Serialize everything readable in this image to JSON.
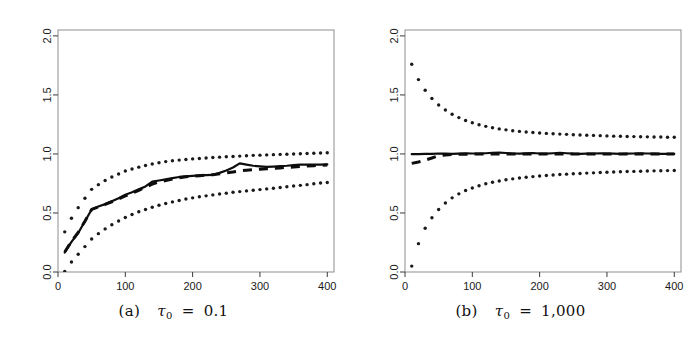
{
  "figure": {
    "panel_count": 2
  },
  "panels": [
    {
      "id": "a",
      "caption_label": "(a)",
      "caption_symbol": "τ",
      "caption_subscript": "0",
      "caption_equals": "=",
      "caption_value": "0.1",
      "caption_full": "(a) τ₀ = 0.1"
    },
    {
      "id": "b",
      "caption_label": "(b)",
      "caption_symbol": "τ",
      "caption_subscript": "0",
      "caption_equals": "=",
      "caption_value": "1,000",
      "caption_full": "(b) τ₀ = 1,000"
    }
  ],
  "chart_data": [
    {
      "type": "line",
      "panel": "a",
      "title": "(a) τ₀ = 0.1",
      "xlabel": "",
      "ylabel": "",
      "xlim": [
        0,
        410
      ],
      "ylim": [
        0.0,
        2.05
      ],
      "xticks": [
        0,
        100,
        200,
        300,
        400
      ],
      "xticklabels": [
        "0",
        "100",
        "200",
        "300",
        "400"
      ],
      "yticks": [
        0.0,
        0.5,
        1.0,
        1.5,
        2.0
      ],
      "yticklabels": [
        "0.0",
        "0.5",
        "1.0",
        "1.5",
        "2.0"
      ],
      "grid": false,
      "legend": "none",
      "x": [
        10,
        20,
        30,
        40,
        50,
        60,
        70,
        80,
        90,
        100,
        110,
        120,
        130,
        140,
        150,
        160,
        170,
        180,
        190,
        200,
        210,
        220,
        230,
        240,
        250,
        260,
        270,
        280,
        290,
        300,
        310,
        320,
        330,
        340,
        350,
        360,
        370,
        380,
        390,
        400
      ],
      "series": [
        {
          "name": "solid-estimate",
          "style": "solid",
          "values": [
            0.165,
            0.255,
            0.33,
            0.43,
            0.53,
            0.555,
            0.575,
            0.6,
            0.625,
            0.655,
            0.675,
            0.7,
            0.725,
            0.765,
            0.775,
            0.785,
            0.795,
            0.805,
            0.81,
            0.815,
            0.818,
            0.82,
            0.822,
            0.84,
            0.86,
            0.885,
            0.92,
            0.91,
            0.9,
            0.895,
            0.89,
            0.893,
            0.897,
            0.9,
            0.905,
            0.91,
            0.91,
            0.91,
            0.91,
            0.912
          ]
        },
        {
          "name": "dashed-theoretical",
          "style": "dashed",
          "values": [
            0.17,
            0.26,
            0.335,
            0.43,
            0.53,
            0.552,
            0.572,
            0.595,
            0.618,
            0.645,
            0.668,
            0.692,
            0.718,
            0.745,
            0.762,
            0.775,
            0.788,
            0.798,
            0.806,
            0.812,
            0.816,
            0.82,
            0.824,
            0.832,
            0.84,
            0.848,
            0.856,
            0.862,
            0.866,
            0.87,
            0.874,
            0.878,
            0.882,
            0.886,
            0.89,
            0.894,
            0.898,
            0.901,
            0.904,
            0.906
          ]
        },
        {
          "name": "dotted-upper-band",
          "style": "dotted",
          "values": [
            0.34,
            0.455,
            0.545,
            0.625,
            0.7,
            0.74,
            0.775,
            0.805,
            0.83,
            0.855,
            0.872,
            0.888,
            0.902,
            0.915,
            0.925,
            0.935,
            0.942,
            0.948,
            0.953,
            0.958,
            0.962,
            0.966,
            0.97,
            0.973,
            0.976,
            0.979,
            0.982,
            0.985,
            0.988,
            0.99,
            0.992,
            0.994,
            0.996,
            0.998,
            1.0,
            1.002,
            1.004,
            1.006,
            1.008,
            1.01
          ]
        },
        {
          "name": "dotted-lower-band",
          "style": "dotted",
          "values": [
            0.005,
            0.085,
            0.15,
            0.215,
            0.28,
            0.325,
            0.365,
            0.4,
            0.432,
            0.462,
            0.487,
            0.51,
            0.53,
            0.548,
            0.565,
            0.58,
            0.594,
            0.606,
            0.618,
            0.628,
            0.637,
            0.645,
            0.653,
            0.661,
            0.668,
            0.675,
            0.681,
            0.687,
            0.693,
            0.698,
            0.704,
            0.71,
            0.716,
            0.722,
            0.728,
            0.734,
            0.74,
            0.748,
            0.754,
            0.758
          ]
        }
      ]
    },
    {
      "type": "line",
      "panel": "b",
      "title": "(b) τ₀ = 1,000",
      "xlabel": "",
      "ylabel": "",
      "xlim": [
        0,
        410
      ],
      "ylim": [
        0.0,
        2.05
      ],
      "xticks": [
        0,
        100,
        200,
        300,
        400
      ],
      "xticklabels": [
        "0",
        "100",
        "200",
        "300",
        "400"
      ],
      "yticks": [
        0.0,
        0.5,
        1.0,
        1.5,
        2.0
      ],
      "yticklabels": [
        "0.0",
        "0.5",
        "1.0",
        "1.5",
        "2.0"
      ],
      "grid": false,
      "legend": "none",
      "x": [
        10,
        20,
        30,
        40,
        50,
        60,
        70,
        80,
        90,
        100,
        110,
        120,
        130,
        140,
        150,
        160,
        170,
        180,
        190,
        200,
        210,
        220,
        230,
        240,
        250,
        260,
        270,
        280,
        290,
        300,
        310,
        320,
        330,
        340,
        350,
        360,
        370,
        380,
        390,
        400
      ],
      "series": [
        {
          "name": "solid-estimate",
          "style": "solid",
          "values": [
            0.998,
            0.999,
            1.0,
            1.001,
            1.004,
            1.002,
            1.0,
            1.003,
            1.006,
            1.004,
            1.002,
            1.006,
            1.01,
            1.012,
            1.008,
            1.004,
            1.002,
            1.005,
            1.008,
            1.004,
            1.002,
            1.006,
            1.01,
            1.006,
            1.002,
            1.0,
            1.002,
            1.004,
            1.006,
            1.004,
            1.002,
            1.0,
            1.002,
            1.004,
            1.006,
            1.004,
            1.002,
            1.001,
            1.0,
            1.0
          ]
        },
        {
          "name": "dashed-theoretical",
          "style": "dashed",
          "values": [
            0.92,
            0.932,
            0.948,
            0.966,
            0.985,
            0.992,
            0.995,
            0.997,
            0.998,
            0.999,
            0.999,
            1.0,
            1.0,
            1.0,
            1.0,
            1.0,
            1.0,
            1.0,
            1.0,
            1.0,
            1.0,
            1.0,
            1.0,
            1.0,
            1.0,
            1.0,
            1.0,
            1.0,
            1.0,
            1.0,
            1.0,
            1.0,
            1.0,
            1.0,
            1.0,
            1.0,
            1.0,
            1.0,
            1.0,
            1.0
          ]
        },
        {
          "name": "dotted-upper-band",
          "style": "dotted",
          "values": [
            1.76,
            1.63,
            1.54,
            1.47,
            1.415,
            1.372,
            1.336,
            1.308,
            1.284,
            1.264,
            1.248,
            1.234,
            1.222,
            1.212,
            1.204,
            1.197,
            1.191,
            1.186,
            1.182,
            1.178,
            1.174,
            1.171,
            1.168,
            1.166,
            1.163,
            1.161,
            1.159,
            1.157,
            1.155,
            1.153,
            1.151,
            1.15,
            1.148,
            1.147,
            1.146,
            1.145,
            1.144,
            1.143,
            1.142,
            1.141
          ]
        },
        {
          "name": "dotted-lower-band",
          "style": "dotted",
          "values": [
            0.05,
            0.24,
            0.37,
            0.46,
            0.53,
            0.585,
            0.628,
            0.662,
            0.69,
            0.712,
            0.731,
            0.747,
            0.76,
            0.771,
            0.781,
            0.789,
            0.796,
            0.802,
            0.808,
            0.813,
            0.818,
            0.822,
            0.826,
            0.829,
            0.832,
            0.835,
            0.838,
            0.84,
            0.843,
            0.845,
            0.847,
            0.849,
            0.851,
            0.852,
            0.854,
            0.855,
            0.857,
            0.858,
            0.859,
            0.86
          ]
        }
      ]
    }
  ]
}
